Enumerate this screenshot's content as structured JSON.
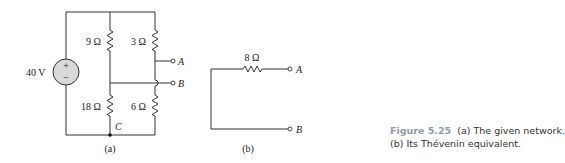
{
  "figure_a": {
    "source_label": "40 V",
    "source_plus": "+",
    "source_minus": "−",
    "r1_label": "9 Ω",
    "r2_label": "3 Ω",
    "r3_label": "18 Ω",
    "r4_label": "6 Ω",
    "node_c": "C",
    "terminal_a": "A",
    "terminal_b": "B",
    "sublabel": "(a)"
  },
  "figure_b": {
    "r_label": "8 Ω",
    "terminal_a": "A",
    "terminal_b": "B",
    "sublabel": "(b)"
  },
  "caption": {
    "figure_number": "Figure 5.25",
    "line1": "(a) The given network.",
    "line2": "(b) Its Thévenin equivalent."
  }
}
